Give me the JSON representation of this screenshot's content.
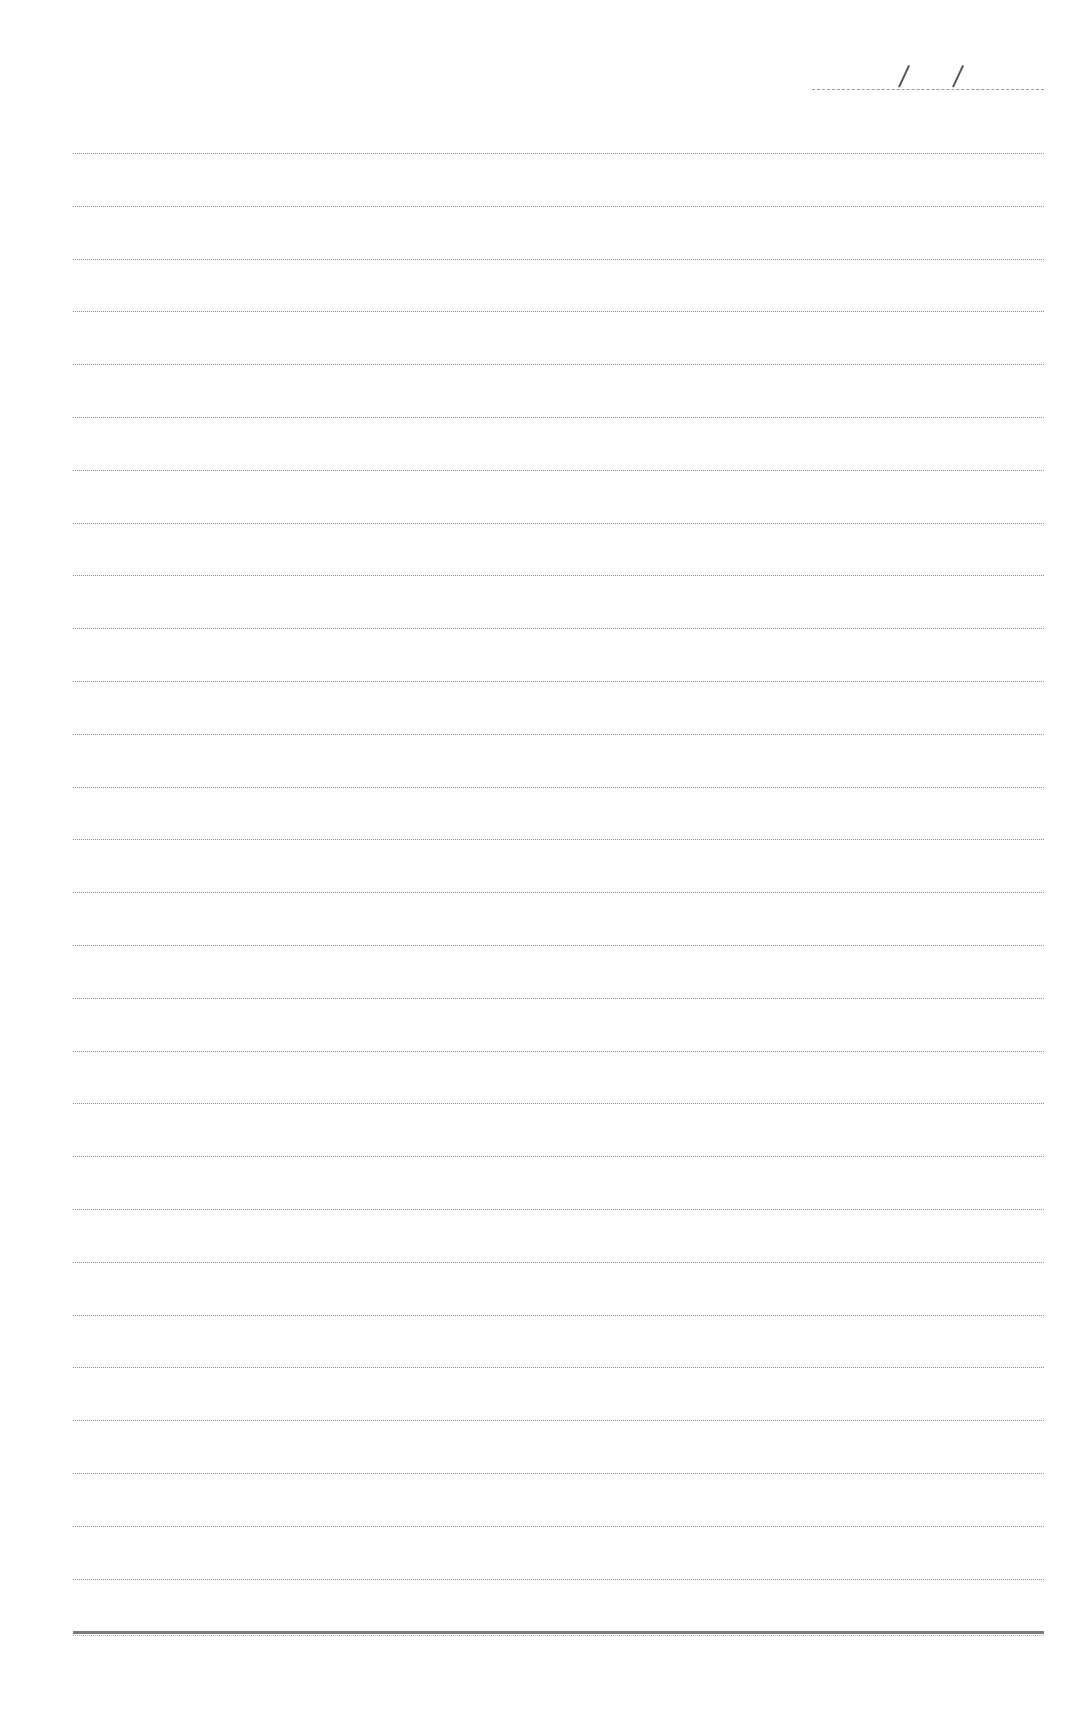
{
  "page": {
    "type": "ruled-notebook-page",
    "background": "#ffffff",
    "line_color": "#8a8a8a"
  },
  "date_field": {
    "separator": "/",
    "value": ""
  },
  "ruled_lines": {
    "count": 29,
    "first_y": 153,
    "spacing": 52.8,
    "left_x": 73,
    "right_x": 1044,
    "last_line_style": "thick"
  },
  "content": ""
}
